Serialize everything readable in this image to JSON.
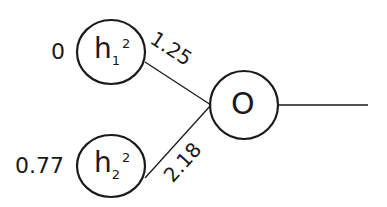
{
  "diagram": {
    "type": "neural-network-output-node",
    "nodes": [
      {
        "id": "h1",
        "base": "h",
        "sub": "1",
        "sup": "2",
        "input_value": "0"
      },
      {
        "id": "h2",
        "base": "h",
        "sub": "2",
        "sup": "2",
        "input_value": "0.77"
      },
      {
        "id": "o",
        "label": "O"
      }
    ],
    "edges": [
      {
        "from": "h1",
        "to": "o",
        "weight": "1.25"
      },
      {
        "from": "h2",
        "to": "o",
        "weight": "2.18"
      }
    ],
    "colors": {
      "stroke": "#1a1a1a",
      "background": "#ffffff"
    }
  }
}
